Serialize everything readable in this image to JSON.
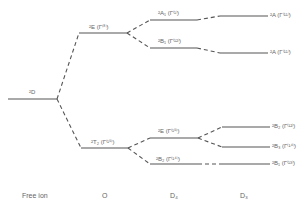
{
  "diagram": {
    "type": "energy-level splitting diagram",
    "columns": [
      {
        "id": "free_ion",
        "label": "Free ion"
      },
      {
        "id": "O",
        "label": "O"
      },
      {
        "id": "D4",
        "label": "D₄"
      },
      {
        "id": "D3",
        "label": "D₃"
      }
    ],
    "levels": {
      "free_ion": [
        {
          "id": "D",
          "label": "²D"
        }
      ],
      "O": [
        {
          "id": "E",
          "label": "²E (Γ⁽⁸⁾)"
        },
        {
          "id": "T2",
          "label": "²T₂ (Γ⁽¹⁵⁾)"
        }
      ],
      "D4": [
        {
          "id": "A1",
          "label": "²A₁ (Γ⁽¹⁾)"
        },
        {
          "id": "B1",
          "label": "²B₁ (Γ⁽¹²⁾)"
        },
        {
          "id": "E",
          "label": "²E (Γ⁽¹⁵⁾)"
        },
        {
          "id": "B2",
          "label": "²B₂ (Γ⁽¹⁴⁾)"
        }
      ],
      "D3": [
        {
          "id": "A_top",
          "label": "²A (Γ⁽¹¹⁾)"
        },
        {
          "id": "A_low",
          "label": "²A (Γ⁽¹¹⁾)"
        },
        {
          "id": "B2",
          "label": "²B₂ (Γ⁽¹²⁾)"
        },
        {
          "id": "B3",
          "label": "²B₃ (Γ⁽¹⁴⁾)"
        },
        {
          "id": "B1",
          "label": "²B₁ (Γ⁽¹³⁾)"
        }
      ]
    },
    "connections": [
      [
        "free_ion.D",
        "O.E"
      ],
      [
        "free_ion.D",
        "O.T2"
      ],
      [
        "O.E",
        "D4.A1"
      ],
      [
        "O.E",
        "D4.B1"
      ],
      [
        "O.T2",
        "D4.E"
      ],
      [
        "O.T2",
        "D4.B2"
      ],
      [
        "D4.A1",
        "D3.A_top"
      ],
      [
        "D4.B1",
        "D3.A_low"
      ],
      [
        "D4.E",
        "D3.B2"
      ],
      [
        "D4.E",
        "D3.B3"
      ],
      [
        "D4.B2",
        "D3.B1"
      ]
    ]
  }
}
